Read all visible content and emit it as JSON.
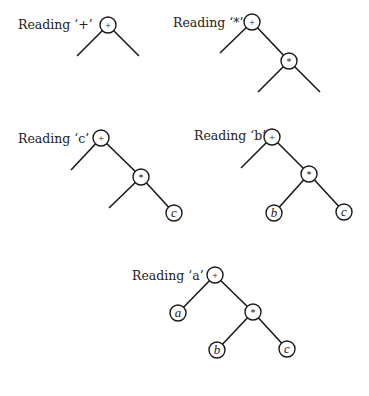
{
  "diagram": {
    "trees": [
      {
        "label": "Reading ‘+’",
        "root": "+",
        "children": [
          "(empty)",
          "(empty)"
        ]
      },
      {
        "label": "Reading ‘*’",
        "root": "+",
        "children": [
          "(empty)",
          {
            "op": "*",
            "children": [
              "(empty)",
              "(empty)"
            ]
          }
        ]
      },
      {
        "label": "Reading ‘c’",
        "root": "+",
        "children": [
          "(empty)",
          {
            "op": "*",
            "children": [
              "(empty)",
              "c"
            ]
          }
        ]
      },
      {
        "label": "Reading ‘b’",
        "root": "+",
        "children": [
          "(empty)",
          {
            "op": "*",
            "children": [
              "b",
              "c"
            ]
          }
        ]
      },
      {
        "label": "Reading ‘a’",
        "root": "+",
        "children": [
          "a",
          {
            "op": "*",
            "children": [
              "b",
              "c"
            ]
          }
        ]
      }
    ],
    "symbols": {
      "plus": "+",
      "times": "*",
      "a": "a",
      "b": "b",
      "c": "c"
    }
  }
}
